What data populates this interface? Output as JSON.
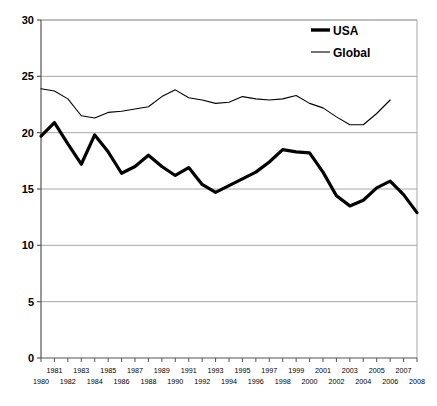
{
  "chart_data": {
    "type": "line",
    "title": "",
    "subtitle": "",
    "xlabel": "",
    "ylabel": "",
    "xlim": [
      1980,
      2008
    ],
    "ylim": [
      0,
      30
    ],
    "grid": true,
    "grid_axis": "y",
    "legend_position": "top-right",
    "yticks": [
      0,
      5,
      10,
      15,
      20,
      25,
      30
    ],
    "ytick_labels": [
      "0",
      "5",
      "10",
      "15",
      "20",
      "25",
      "30"
    ],
    "x": [
      1980,
      1981,
      1982,
      1983,
      1984,
      1985,
      1986,
      1987,
      1988,
      1989,
      1990,
      1991,
      1992,
      1993,
      1994,
      1995,
      1996,
      1997,
      1998,
      1999,
      2000,
      2001,
      2002,
      2003,
      2004,
      2005,
      2006,
      2007,
      2008
    ],
    "xtick_labels_top": [
      "",
      "1981",
      "",
      "1983",
      "",
      "1985",
      "",
      "1987",
      "",
      "1989",
      "",
      "1991",
      "",
      "1993",
      "",
      "1995",
      "",
      "1997",
      "",
      "1999",
      "",
      "2001",
      "",
      "2003",
      "",
      "2005",
      "",
      "2007",
      ""
    ],
    "xtick_labels_bottom": [
      "1980",
      "",
      "1982",
      "",
      "1984",
      "",
      "1986",
      "",
      "1988",
      "",
      "1990",
      "",
      "1992",
      "",
      "1994",
      "",
      "1996",
      "",
      "1998",
      "",
      "2000",
      "",
      "2002",
      "",
      "2004",
      "",
      "2006",
      "",
      "2008"
    ],
    "series": [
      {
        "name": "USA",
        "color": "#000000",
        "line_width": 3.2,
        "x": [
          1980,
          1981,
          1982,
          1983,
          1984,
          1985,
          1986,
          1987,
          1988,
          1989,
          1990,
          1991,
          1992,
          1993,
          1994,
          1995,
          1996,
          1997,
          1998,
          1999,
          2000,
          2001,
          2002,
          2003,
          2004,
          2005,
          2006,
          2007,
          2008
        ],
        "values": [
          19.7,
          20.9,
          19.0,
          17.2,
          19.8,
          18.3,
          16.4,
          17.0,
          18.0,
          17.0,
          16.2,
          16.9,
          15.4,
          14.7,
          15.3,
          15.9,
          16.5,
          17.4,
          18.5,
          18.3,
          18.2,
          16.5,
          14.4,
          13.5,
          14.0,
          15.1,
          15.7,
          14.5,
          12.9
        ]
      },
      {
        "name": "Global",
        "color": "#000000",
        "line_width": 1.1,
        "x": [
          1980,
          1981,
          1982,
          1983,
          1984,
          1985,
          1986,
          1987,
          1988,
          1989,
          1990,
          1991,
          1992,
          1993,
          1994,
          1995,
          1996,
          1997,
          1998,
          1999,
          2000,
          2001,
          2002,
          2003,
          2004,
          2005,
          2006
        ],
        "values": [
          23.9,
          23.7,
          23.0,
          21.5,
          21.3,
          21.8,
          21.9,
          22.1,
          22.3,
          23.2,
          23.8,
          23.1,
          22.9,
          22.6,
          22.7,
          23.2,
          23.0,
          22.9,
          23.0,
          23.3,
          22.6,
          22.2,
          21.4,
          20.7,
          20.7,
          21.7,
          22.9
        ]
      }
    ]
  },
  "legend": {
    "items": [
      {
        "label": "USA",
        "style": "thick"
      },
      {
        "label": "Global",
        "style": "thin"
      }
    ]
  },
  "axes": {
    "y_axis_name": "value-axis",
    "x_axis_name": "year-axis"
  }
}
